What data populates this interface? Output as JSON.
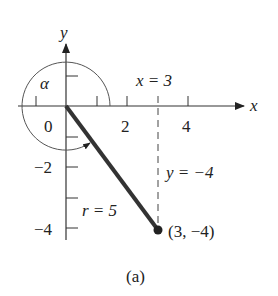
{
  "figure": {
    "caption": "(a)",
    "axes": {
      "x_label": "x",
      "y_label": "y",
      "x_ticks": [
        "0",
        "2",
        "4"
      ],
      "y_ticks": [
        "−2",
        "−4"
      ]
    },
    "angle_label": "α",
    "point_label": "(3, −4)",
    "x_eq": "x = 3",
    "y_eq": "y = −4",
    "r_eq": "r = 5",
    "colors": {
      "axis": "#333333",
      "segment": "#333333",
      "arc": "#555555"
    }
  }
}
